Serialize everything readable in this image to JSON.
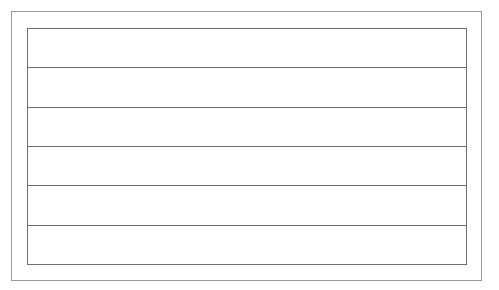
{
  "form": {
    "rows": [
      {
        "value": ""
      },
      {
        "value": ""
      },
      {
        "value": ""
      },
      {
        "value": ""
      },
      {
        "value": ""
      },
      {
        "value": ""
      }
    ]
  }
}
